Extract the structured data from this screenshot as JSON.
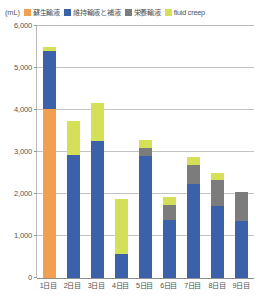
{
  "chart_data": {
    "type": "bar",
    "stacked": true,
    "title": "",
    "subtitle": "",
    "unit_label": "(mL)",
    "xlabel": "",
    "ylabel": "",
    "ylim": [
      0,
      6000
    ],
    "ytick_step": 1000,
    "ytick_labels": [
      "6,000",
      "5,000",
      "4,000",
      "3,000",
      "2,000",
      "1,000",
      "0"
    ],
    "ytick_values": [
      6000,
      5000,
      4000,
      3000,
      2000,
      1000,
      0
    ],
    "grid": true,
    "legend_position": "top",
    "categories": [
      "1日目",
      "2日目",
      "3日目",
      "4日目",
      "5日目",
      "6日目",
      "7日目",
      "8日目",
      "9日目"
    ],
    "series": [
      {
        "name": "蘇生輸液",
        "color": "#f0a050",
        "values": [
          4020,
          0,
          0,
          0,
          0,
          0,
          0,
          0,
          0
        ]
      },
      {
        "name": "維持輸液と補液",
        "color": "#3b62a8",
        "values": [
          1380,
          2930,
          3260,
          560,
          2900,
          1380,
          2250,
          1720,
          1350
        ]
      },
      {
        "name": "栄養輸液",
        "color": "#7c7c7c",
        "values": [
          0,
          0,
          0,
          0,
          190,
          370,
          440,
          620,
          700
        ]
      },
      {
        "name": "fluid creep",
        "color": "#d4e157",
        "values": [
          100,
          810,
          900,
          1330,
          200,
          180,
          190,
          170,
          0
        ]
      }
    ],
    "totals": [
      5500,
      3740,
      4160,
      1890,
      3290,
      1930,
      2880,
      2510,
      2050
    ]
  }
}
